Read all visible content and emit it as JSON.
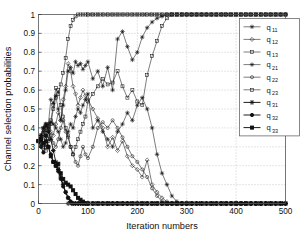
{
  "figure": {
    "background": "#ffffff",
    "foreground": "#1a1a1a"
  },
  "axes": {
    "xlabel": "Iteration numbers",
    "ylabel": "Channel selection probabilities",
    "x_ticks": [
      "0",
      "100",
      "200",
      "300",
      "400",
      "500"
    ],
    "y_ticks": [
      "0",
      "0.1",
      "0.2",
      "0.3",
      "0.4",
      "0.5",
      "0.6",
      "0.7",
      "0.8",
      "0.9",
      "1"
    ],
    "grid": "dotted"
  },
  "legend": {
    "position": "top-right",
    "entries": [
      {
        "label": "q",
        "sub": "11",
        "marker": "star",
        "weight": "thin"
      },
      {
        "label": "q",
        "sub": "12",
        "marker": "diamond",
        "weight": "thin"
      },
      {
        "label": "q",
        "sub": "13",
        "marker": "square",
        "weight": "thin"
      },
      {
        "label": "q",
        "sub": "21",
        "marker": "star",
        "weight": "thin"
      },
      {
        "label": "q",
        "sub": "22",
        "marker": "circle",
        "weight": "thin"
      },
      {
        "label": "q",
        "sub": "23",
        "marker": "square",
        "weight": "thin"
      },
      {
        "label": "q",
        "sub": "31",
        "marker": "star",
        "weight": "bold"
      },
      {
        "label": "q",
        "sub": "32",
        "marker": "circle",
        "weight": "bold"
      },
      {
        "label": "q",
        "sub": "33",
        "marker": "square",
        "weight": "bold"
      }
    ]
  },
  "chart_data": {
    "type": "line",
    "title": "",
    "xlabel": "Iteration numbers",
    "ylabel": "Channel selection probabilities",
    "xlim": [
      0,
      500
    ],
    "ylim": [
      0,
      1
    ],
    "xticks": [
      0,
      100,
      200,
      300,
      400,
      500
    ],
    "yticks": [
      0,
      0.1,
      0.2,
      0.3,
      0.4,
      0.5,
      0.6,
      0.7,
      0.8,
      0.9,
      1.0
    ],
    "grid": true,
    "legend_position": "upper right",
    "x": [
      0,
      5,
      10,
      15,
      20,
      25,
      30,
      35,
      40,
      45,
      50,
      55,
      60,
      65,
      70,
      75,
      80,
      85,
      90,
      95,
      100,
      110,
      120,
      130,
      140,
      150,
      160,
      170,
      180,
      190,
      200,
      210,
      220,
      230,
      240,
      250,
      260,
      270,
      280,
      290,
      300,
      310,
      320,
      330,
      340,
      350,
      360,
      370,
      380,
      390,
      400,
      410,
      420,
      430,
      440,
      450,
      460,
      470,
      480,
      490,
      500
    ],
    "series": [
      {
        "name": "q11",
        "marker": "star",
        "weight": "thin",
        "values": [
          0.33,
          0.36,
          0.4,
          0.38,
          0.42,
          0.55,
          0.53,
          0.57,
          0.5,
          0.44,
          0.52,
          0.6,
          0.7,
          0.72,
          0.69,
          0.75,
          0.73,
          0.74,
          0.71,
          0.73,
          0.75,
          0.66,
          0.7,
          0.62,
          0.72,
          0.6,
          0.87,
          0.91,
          0.83,
          0.76,
          0.8,
          0.88,
          0.93,
          0.96,
          0.98,
          0.99,
          1,
          1,
          1,
          1,
          1,
          1,
          1,
          1,
          1,
          1,
          1,
          1,
          1,
          1,
          1,
          1,
          1,
          1,
          1,
          1,
          1,
          1,
          1,
          1,
          1
        ]
      },
      {
        "name": "q12",
        "marker": "diamond",
        "weight": "thin",
        "values": [
          0.33,
          0.31,
          0.35,
          0.4,
          0.42,
          0.38,
          0.36,
          0.42,
          0.48,
          0.44,
          0.55,
          0.62,
          0.74,
          0.7,
          0.62,
          0.58,
          0.52,
          0.56,
          0.6,
          0.57,
          0.55,
          0.5,
          0.45,
          0.4,
          0.3,
          0.35,
          0.28,
          0.33,
          0.25,
          0.2,
          0.18,
          0.14,
          0.23,
          0.1,
          0.06,
          0.03,
          0.01,
          0,
          0,
          0,
          0,
          0,
          0,
          0,
          0,
          0,
          0,
          0,
          0,
          0,
          0,
          0,
          0,
          0,
          0,
          0,
          0,
          0,
          0,
          0,
          0
        ]
      },
      {
        "name": "q13",
        "marker": "square",
        "weight": "thin",
        "values": [
          0.33,
          0.34,
          0.3,
          0.28,
          0.33,
          0.44,
          0.52,
          0.61,
          0.58,
          0.63,
          0.69,
          0.77,
          0.87,
          0.94,
          0.97,
          0.99,
          1,
          1,
          1,
          1,
          1,
          1,
          1,
          1,
          1,
          1,
          1,
          1,
          1,
          1,
          1,
          1,
          1,
          1,
          1,
          1,
          1,
          1,
          1,
          1,
          1,
          1,
          1,
          1,
          1,
          1,
          1,
          1,
          1,
          1,
          1,
          1,
          1,
          1,
          1,
          1,
          1,
          1,
          1,
          1,
          1
        ]
      },
      {
        "name": "q21",
        "marker": "star",
        "weight": "thin",
        "values": [
          0.33,
          0.35,
          0.38,
          0.41,
          0.4,
          0.43,
          0.42,
          0.4,
          0.38,
          0.34,
          0.3,
          0.32,
          0.38,
          0.42,
          0.4,
          0.46,
          0.5,
          0.48,
          0.52,
          0.55,
          0.58,
          0.4,
          0.44,
          0.38,
          0.34,
          0.3,
          0.38,
          0.42,
          0.48,
          0.44,
          0.52,
          0.56,
          0.5,
          0.4,
          0.26,
          0.16,
          0.1,
          0.04,
          0.01,
          0,
          0,
          0,
          0,
          0,
          0,
          0,
          0,
          0,
          0,
          0,
          0,
          0,
          0,
          0,
          0,
          0,
          0,
          0,
          0,
          0,
          0
        ]
      },
      {
        "name": "q22",
        "marker": "circle",
        "weight": "thin",
        "values": [
          0.33,
          0.32,
          0.36,
          0.42,
          0.4,
          0.36,
          0.32,
          0.3,
          0.34,
          0.4,
          0.44,
          0.38,
          0.35,
          0.3,
          0.26,
          0.22,
          0.2,
          0.25,
          0.3,
          0.26,
          0.24,
          0.3,
          0.4,
          0.43,
          0.4,
          0.44,
          0.4,
          0.35,
          0.3,
          0.25,
          0.22,
          0.18,
          0.14,
          0.08,
          0.04,
          0.01,
          0,
          0,
          0,
          0,
          0,
          0,
          0,
          0,
          0,
          0,
          0,
          0,
          0,
          0,
          0,
          0,
          0,
          0,
          0,
          0,
          0,
          0,
          0,
          0,
          0
        ]
      },
      {
        "name": "q23",
        "marker": "square",
        "weight": "thin",
        "values": [
          0.33,
          0.34,
          0.31,
          0.3,
          0.34,
          0.42,
          0.5,
          0.56,
          0.6,
          0.52,
          0.46,
          0.4,
          0.36,
          0.3,
          0.26,
          0.3,
          0.34,
          0.38,
          0.42,
          0.46,
          0.54,
          0.58,
          0.62,
          0.66,
          0.63,
          0.64,
          0.7,
          0.62,
          0.56,
          0.6,
          0.54,
          0.52,
          0.68,
          0.78,
          0.86,
          0.94,
          0.98,
          1,
          1,
          1,
          1,
          1,
          1,
          1,
          1,
          1,
          1,
          1,
          1,
          1,
          1,
          1,
          1,
          1,
          1,
          1,
          1,
          1,
          1,
          1,
          1
        ]
      },
      {
        "name": "q31",
        "marker": "star",
        "weight": "bold",
        "values": [
          0.33,
          0.36,
          0.4,
          0.42,
          0.38,
          0.34,
          0.28,
          0.22,
          0.18,
          0.14,
          0.1,
          0.06,
          0.03,
          0.01,
          0,
          0,
          0,
          0,
          0,
          0,
          0,
          0,
          0,
          0,
          0,
          0,
          0,
          0,
          0,
          0,
          0,
          0,
          0,
          0,
          0,
          0,
          0,
          0,
          0,
          0,
          0,
          0,
          0,
          0,
          0,
          0,
          0,
          0,
          0,
          0,
          0,
          0,
          0,
          0,
          0,
          0,
          0,
          0,
          0,
          0,
          0
        ]
      },
      {
        "name": "q32",
        "marker": "circle",
        "weight": "bold",
        "values": [
          0.33,
          0.3,
          0.27,
          0.33,
          0.3,
          0.26,
          0.22,
          0.2,
          0.17,
          0.13,
          0.09,
          0.06,
          0.03,
          0.01,
          0,
          0,
          0,
          0,
          0,
          0,
          0,
          0,
          0,
          0,
          0,
          0,
          0,
          0,
          0,
          0,
          0,
          0,
          0,
          0,
          0,
          0,
          0,
          0,
          0,
          0,
          0,
          0,
          0,
          0,
          0,
          0,
          0,
          0,
          0,
          0,
          0,
          0,
          0,
          0,
          0,
          0,
          0,
          0,
          0,
          0,
          0
        ]
      },
      {
        "name": "q33",
        "marker": "square",
        "weight": "bold",
        "values": [
          0.33,
          0.34,
          0.32,
          0.36,
          0.3,
          0.25,
          0.22,
          0.2,
          0.21,
          0.16,
          0.13,
          0.11,
          0.1,
          0.09,
          0.07,
          0.05,
          0.03,
          0.02,
          0.01,
          0,
          0,
          0,
          0,
          0,
          0,
          0,
          0,
          0,
          0,
          0,
          0,
          0,
          0,
          0,
          0,
          0,
          0,
          0,
          0,
          0,
          0,
          0,
          0,
          0,
          0,
          0,
          0,
          0,
          0,
          0,
          0,
          0,
          0,
          0,
          0,
          0,
          0,
          0,
          0,
          0,
          0
        ]
      }
    ]
  }
}
